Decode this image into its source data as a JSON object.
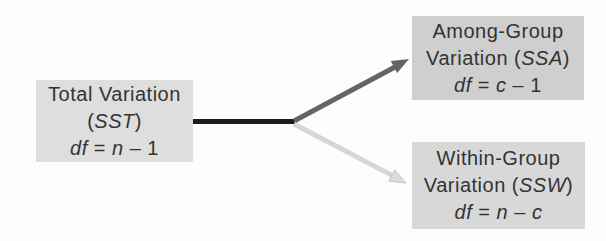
{
  "canvas": {
    "width": 606,
    "height": 241,
    "background": "#fdfdfd"
  },
  "colors": {
    "text": "#333333",
    "total_box_bg": "#dedede",
    "among_box_bg": "#cfcfcf",
    "within_box_bg": "#d8d8d8",
    "trunk_line": "#1c1c1c",
    "among_arrow": "#646464",
    "within_arrow": "#d6d6d6",
    "within_arrow_fill": "#dadada",
    "within_arrow_edge": "#c3c3c3"
  },
  "nodes": {
    "total": {
      "line1": "Total Variation",
      "line2": {
        "pre": "(",
        "term": "SST",
        "post": ")"
      },
      "line3": {
        "p1": "df",
        "p2": " = ",
        "p3": "n",
        "p4": " – 1",
        "p5": ""
      }
    },
    "among": {
      "line1": "Among-Group",
      "line2": {
        "pre": "Variation (",
        "term": "SSA",
        "post": ")"
      },
      "line3": {
        "p1": "df",
        "p2": " = ",
        "p3": "c",
        "p4": " – 1",
        "p5": ""
      }
    },
    "within": {
      "line1": "Within-Group",
      "line2": {
        "pre": "Variation (",
        "term": "SSW",
        "post": ")"
      },
      "line3": {
        "p1": "df",
        "p2": " = ",
        "p3": "n",
        "p4": " – ",
        "p5": "c"
      }
    }
  }
}
